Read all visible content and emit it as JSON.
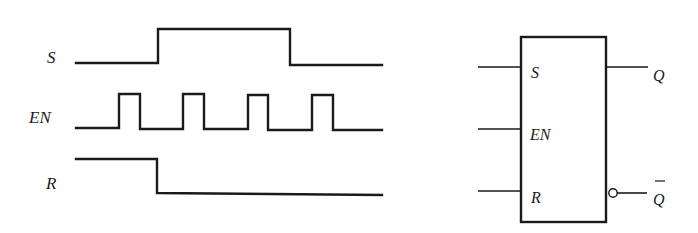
{
  "timing_diagram": {
    "signals": [
      {
        "name": "S",
        "label": "S",
        "waveform": "low until t1, high t1..t2, low after",
        "transitions_x": [
          158,
          290
        ],
        "initial": "low"
      },
      {
        "name": "EN",
        "label": "EN",
        "waveform": "four positive pulses",
        "pulses_x": [
          [
            119,
            140
          ],
          [
            183,
            204
          ],
          [
            248,
            268
          ],
          [
            312,
            333
          ]
        ],
        "initial": "low"
      },
      {
        "name": "R",
        "label": "R",
        "waveform": "high until t1, low after",
        "transitions_x": [
          157
        ],
        "initial": "high"
      }
    ]
  },
  "logic_symbol": {
    "inputs": [
      {
        "pin": "S",
        "label": "S"
      },
      {
        "pin": "EN",
        "label": "EN"
      },
      {
        "pin": "R",
        "label": "R"
      }
    ],
    "outputs": [
      {
        "pin": "Q",
        "label": "Q",
        "inverted_bubble": false
      },
      {
        "pin": "Q_bar",
        "label": "Q",
        "overbar": true,
        "inverted_bubble": true
      }
    ]
  }
}
